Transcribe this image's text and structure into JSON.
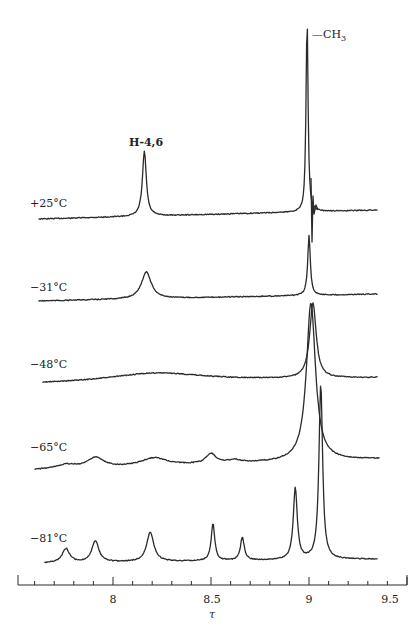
{
  "chart_data": {
    "type": "line",
    "title": "",
    "xlabel": "τ",
    "ylabel": "",
    "xlim": [
      7.5,
      9.6
    ],
    "x_reversed": false,
    "grid": false,
    "x_ticks": [
      {
        "value": 8,
        "label": "8"
      },
      {
        "value": 8.5,
        "label": "8.5"
      },
      {
        "value": 9,
        "label": "9"
      },
      {
        "value": 9.5,
        "label": "9.5"
      }
    ],
    "minor_tick_step": 0.1,
    "annotations": [
      {
        "text": "H-4,6",
        "x": 8.16,
        "trace": "+25°C"
      },
      {
        "text": "—CH₃",
        "x": 9.0,
        "trace": "+25°C"
      }
    ],
    "series": [
      {
        "name": "+25°C",
        "label": "+25°C",
        "x_range": [
          7.62,
          9.35
        ],
        "baseline_y_left": 219,
        "baseline_y_right": 210,
        "peaks": [
          {
            "tau": 8.16,
            "height": 65,
            "width": 0.012
          },
          {
            "tau": 8.99,
            "height": 196,
            "width": 0.006
          }
        ],
        "note": "CH3 peak with ringing spike at τ≈9.02"
      },
      {
        "name": "−31°C",
        "label": "−31°C",
        "x_range": [
          7.62,
          9.35
        ],
        "baseline_y_left": 301,
        "baseline_y_right": 294,
        "peaks": [
          {
            "tau": 8.17,
            "height": 27,
            "width": 0.03
          },
          {
            "tau": 9.0,
            "height": 60,
            "width": 0.008
          }
        ],
        "note": "CH3 peak truncated at top"
      },
      {
        "name": "−48°C",
        "label": "−48°C",
        "x_range": [
          7.64,
          9.35
        ],
        "baseline_y_left": 384,
        "baseline_y_right": 378,
        "peaks": [
          {
            "tau": 8.22,
            "height": 9,
            "width": 0.3
          },
          {
            "tau": 9.02,
            "height": 75,
            "width": 0.02
          }
        ],
        "note": "broad hump; CH3 peak merged with −65°C trace"
      },
      {
        "name": "−65°C",
        "label": "−65°C",
        "x_range": [
          7.6,
          9.36
        ],
        "baseline_y_left": 470,
        "baseline_y_right": 459,
        "peaks": [
          {
            "tau": 7.76,
            "height": 4,
            "width": 0.06
          },
          {
            "tau": 7.91,
            "height": 10,
            "width": 0.05
          },
          {
            "tau": 8.21,
            "height": 8,
            "width": 0.08
          },
          {
            "tau": 8.5,
            "height": 10,
            "width": 0.03
          },
          {
            "tau": 8.62,
            "height": 3,
            "width": 0.04
          },
          {
            "tau": 9.01,
            "height": 158,
            "width": 0.028
          }
        ]
      },
      {
        "name": "−81°C",
        "label": "−81°C",
        "x_range": [
          7.65,
          9.35
        ],
        "baseline_y_left": 563,
        "baseline_y_right": 559,
        "peaks": [
          {
            "tau": 7.76,
            "height": 14,
            "width": 0.022
          },
          {
            "tau": 7.91,
            "height": 21,
            "width": 0.022
          },
          {
            "tau": 8.19,
            "height": 29,
            "width": 0.022
          },
          {
            "tau": 8.51,
            "height": 37,
            "width": 0.011
          },
          {
            "tau": 8.66,
            "height": 23,
            "width": 0.012
          },
          {
            "tau": 8.93,
            "height": 72,
            "width": 0.012
          },
          {
            "tau": 9.06,
            "height": 176,
            "width": 0.011
          }
        ]
      }
    ]
  },
  "labels": {
    "trace_25": "+25°C",
    "trace_m31": "−31°C",
    "trace_m48": "−48°C",
    "trace_m65": "−65°C",
    "trace_m81": "−81°C",
    "peak_h46": "H-4,6",
    "peak_ch3": "—CH",
    "peak_ch3_sub": "3",
    "x_axis_label": "τ",
    "tick_8": "8",
    "tick_85": "8.5",
    "tick_9": "9",
    "tick_95": "9.5"
  }
}
